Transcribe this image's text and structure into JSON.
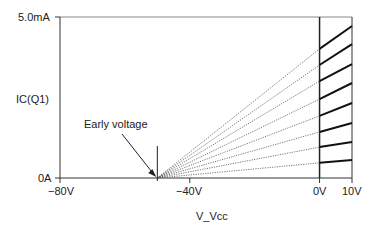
{
  "chart_data": {
    "type": "line",
    "title": "",
    "xlabel": "V_Vcc",
    "ylabel": "IC(Q1)",
    "xlim": [
      -80,
      10
    ],
    "ylim": [
      0,
      5.0
    ],
    "y_unit": "mA",
    "x_ticks": [
      {
        "value": -80,
        "label": "−80V"
      },
      {
        "value": -40,
        "label": "−40V"
      },
      {
        "value": 0,
        "label": "0V"
      },
      {
        "value": 10,
        "label": "10V"
      }
    ],
    "y_ticks": [
      {
        "value": 0,
        "label": "0A"
      },
      {
        "value": 5.0,
        "label": "5.0mA"
      }
    ],
    "grid": false,
    "early_voltage": -50,
    "annotation": {
      "text": "Early voltage",
      "points_to_x": -50
    },
    "series": [
      {
        "name": "curve 1",
        "i_at_0V": 4.01,
        "i_at_10V": 4.72
      },
      {
        "name": "curve 2",
        "i_at_0V": 3.51,
        "i_at_10V": 4.16
      },
      {
        "name": "curve 3",
        "i_at_0V": 3.01,
        "i_at_10V": 3.54
      },
      {
        "name": "curve 4",
        "i_at_0V": 2.45,
        "i_at_10V": 2.95
      },
      {
        "name": "curve 5",
        "i_at_0V": 1.93,
        "i_at_10V": 2.33
      },
      {
        "name": "curve 6",
        "i_at_0V": 1.43,
        "i_at_10V": 1.71
      },
      {
        "name": "curve 7",
        "i_at_0V": 0.96,
        "i_at_10V": 1.12
      },
      {
        "name": "curve 8",
        "i_at_0V": 0.47,
        "i_at_10V": 0.56
      }
    ]
  },
  "labels": {
    "y_max": "5.0mA",
    "y_min": "0A",
    "y_axis": "IC(Q1)",
    "x_axis": "V_Vcc",
    "x_m80": "−80V",
    "x_m40": "−40V",
    "x_0": "0V",
    "x_10": "10V",
    "annotation": "Early voltage"
  }
}
